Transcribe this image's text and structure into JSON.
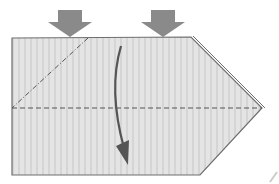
{
  "diagram": {
    "type": "origami-fold-step",
    "colors": {
      "paper_fill": "#e2e2e2",
      "paper_stripe": "#d6d6d6",
      "paper_edge": "#6e6e6e",
      "fold_line": "#555555",
      "push_arrow": "#8a8a8a",
      "fold_arrow": "#555555"
    },
    "elements": [
      {
        "name": "paper-sheet",
        "desc": "rectangle with pointed right end"
      },
      {
        "name": "valley-fold-line",
        "style": "dashed",
        "desc": "horizontal center fold"
      },
      {
        "name": "mountain-fold-line",
        "style": "dash-dot",
        "desc": "diagonal at left corner"
      },
      {
        "name": "push-arrow-left",
        "desc": "downward block arrow"
      },
      {
        "name": "push-arrow-right",
        "desc": "downward block arrow"
      },
      {
        "name": "fold-direction-arrow",
        "desc": "curved arrow pointing down"
      }
    ]
  }
}
